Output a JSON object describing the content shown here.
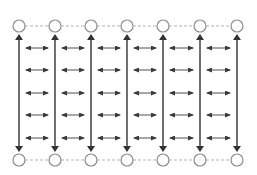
{
  "diagram": {
    "type": "grid-network",
    "columns": 7,
    "column_x": [
      19,
      55,
      91,
      127,
      163,
      200,
      237
    ],
    "top_node_y": 26,
    "bottom_node_y": 160,
    "node_radius": 6,
    "horizontal_arrow_rows_y": [
      48,
      70,
      93,
      115,
      138
    ],
    "vertical_arrow_top_y": 34,
    "vertical_arrow_bottom_y": 152,
    "nodes": {
      "top": [
        "node-1",
        "node-2",
        "node-3",
        "node-4",
        "node-5",
        "node-6",
        "node-7"
      ],
      "bottom": [
        "node-1",
        "node-2",
        "node-3",
        "node-4",
        "node-5",
        "node-6",
        "node-7"
      ]
    },
    "edges": {
      "node_links": "dashed",
      "vertical": "double-headed",
      "horizontal": "double-headed"
    }
  },
  "colors": {
    "background": "#ffffff",
    "node_stroke": "#8c8c8c",
    "node_fill": "#ffffff",
    "dashed_link": "#b4b4b4",
    "vertical_arrow": "#333333",
    "horizontal_arrow": "#3a3a3a"
  }
}
